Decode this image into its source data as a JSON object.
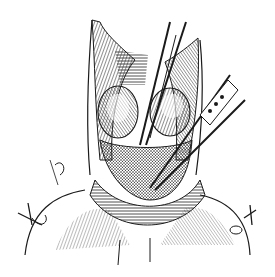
{
  "image": {
    "description": "Black-and-white surgical engraving: open neck incision with retracted skin flaps, exposed thyroid lobes, forceps and clamps inserted from upper right, sutures at lower left and right",
    "colors": {
      "ink": "#1a1a1a",
      "paper": "#ffffff",
      "shade": "#555555"
    }
  }
}
